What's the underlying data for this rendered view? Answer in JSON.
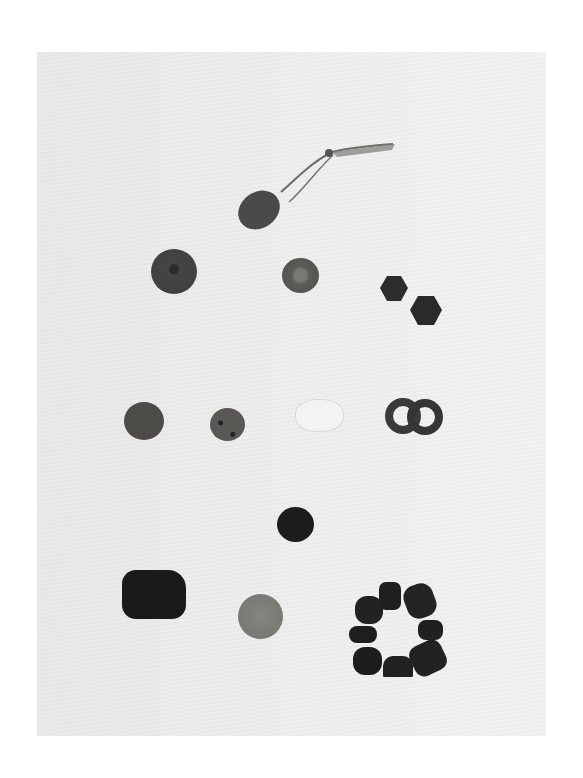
{
  "photo": {
    "subject": "collection of beads and pendant on white background",
    "background_color": "#ececec",
    "items": [
      {
        "name": "pendant-with-cord",
        "color": "#4a4a48"
      },
      {
        "name": "large-round-bead",
        "color": "#434342"
      },
      {
        "name": "medium-round-bead",
        "color": "#5e5c58"
      },
      {
        "name": "hexagonal-bead-1",
        "color": "#2d2d2d"
      },
      {
        "name": "hexagonal-bead-2",
        "color": "#2a2a2a"
      },
      {
        "name": "round-bead-left",
        "color": "#4c4b48"
      },
      {
        "name": "spotted-round-bead",
        "color": "#5a5855"
      },
      {
        "name": "clear-crystal-bead",
        "color": "#e4e6e8"
      },
      {
        "name": "double-ring-bead",
        "color": "#3a3a38"
      },
      {
        "name": "dark-round-bead",
        "color": "#1c1c1c"
      },
      {
        "name": "barrel-bead",
        "color": "#1a1a1a"
      },
      {
        "name": "light-round-bead",
        "color": "#7d7b77"
      },
      {
        "name": "bead-ring-cluster",
        "color": "#1f1f1f",
        "count": 8
      }
    ]
  }
}
